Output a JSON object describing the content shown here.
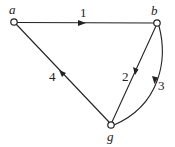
{
  "nodes": [
    {
      "id": "a",
      "label": "a",
      "x": 14,
      "y": 22
    },
    {
      "id": "b",
      "label": "b",
      "x": 157,
      "y": 23
    },
    {
      "id": "g",
      "label": "g",
      "x": 111,
      "y": 125
    }
  ],
  "edges": [
    {
      "id": "1",
      "label": "1",
      "from": "a",
      "to": "b",
      "shape": "straight"
    },
    {
      "id": "2",
      "label": "2",
      "from": "b",
      "to": "g",
      "shape": "straight"
    },
    {
      "id": "3",
      "label": "3",
      "from": "b",
      "to": "g",
      "shape": "curved"
    },
    {
      "id": "4",
      "label": "4",
      "from": "g",
      "to": "a",
      "shape": "straight"
    }
  ],
  "colors": {
    "stroke": "#222222",
    "background": "#ffffff"
  }
}
